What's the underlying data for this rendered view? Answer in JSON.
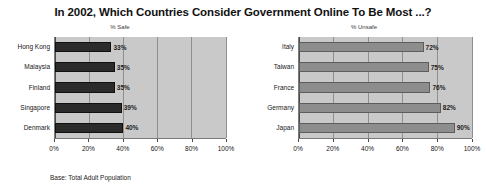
{
  "title": "In 2002, Which Countries Consider Government Online To Be Most ...?",
  "footnote": "Base: Total Adult Population",
  "colors": {
    "safe_bar": "#2b2b2b",
    "unsafe_bar": "#8d8d8d",
    "plot_background": "#c9c9c9",
    "gridline": "#8f8f8f"
  },
  "chart_data": [
    {
      "type": "bar",
      "title": "% Safe",
      "orientation": "horizontal",
      "categories": [
        "Hong Kong",
        "Malaysia",
        "Finland",
        "Singapore",
        "Denmark"
      ],
      "values": [
        33,
        35,
        35,
        39,
        40
      ],
      "data_labels": [
        "33%",
        "35%",
        "35%",
        "39%",
        "40%"
      ],
      "xlabel": "",
      "ylabel": "",
      "xlim": [
        0,
        100
      ],
      "xticks": [
        0,
        20,
        40,
        60,
        80,
        100
      ],
      "xticklabels": [
        "0%",
        "20%",
        "40%",
        "60%",
        "80%",
        "100%"
      ],
      "grid": true,
      "legend": false
    },
    {
      "type": "bar",
      "title": "% Unsafe",
      "orientation": "horizontal",
      "categories": [
        "Italy",
        "Taiwan",
        "France",
        "Germany",
        "Japan"
      ],
      "values": [
        72,
        75,
        76,
        82,
        90
      ],
      "data_labels": [
        "72%",
        "75%",
        "76%",
        "82%",
        "90%"
      ],
      "xlabel": "",
      "ylabel": "",
      "xlim": [
        0,
        100
      ],
      "xticks": [
        0,
        20,
        40,
        60,
        80,
        100
      ],
      "xticklabels": [
        "0%",
        "20%",
        "40%",
        "60%",
        "80%",
        "100%"
      ],
      "grid": true,
      "legend": false
    }
  ]
}
